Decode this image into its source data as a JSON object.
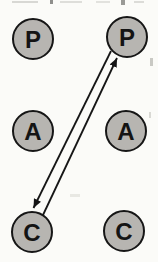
{
  "diagram": {
    "nodes": [
      {
        "id": "left-parent",
        "column": "left",
        "label": "P"
      },
      {
        "id": "right-parent",
        "column": "right",
        "label": "P"
      },
      {
        "id": "left-adult",
        "column": "left",
        "label": "A"
      },
      {
        "id": "right-adult",
        "column": "right",
        "label": "A"
      },
      {
        "id": "left-child",
        "column": "left",
        "label": "C"
      },
      {
        "id": "right-child",
        "column": "right",
        "label": "C"
      }
    ],
    "connections": [
      {
        "from": "left-child",
        "to": "right-parent",
        "arrowhead_at": "right-parent",
        "style": "straight-line"
      },
      {
        "from": "right-parent",
        "to": "left-child",
        "arrowhead_at": "left-child",
        "style": "straight-line"
      }
    ],
    "colors": {
      "node_fill": "#b7b5b1",
      "node_stroke": "#161616",
      "label_color": "#141414",
      "arrow_color": "#161616",
      "background": "#fbfbf8"
    }
  }
}
